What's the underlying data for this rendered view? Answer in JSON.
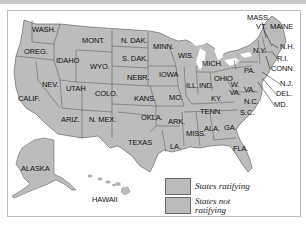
{
  "map": {
    "title": "",
    "state_fill": "#bcbcbc",
    "border_color": "#555555",
    "water_color": "#ffffff",
    "states": [
      {
        "abbr": "WASH.",
        "x": 32,
        "y": 29
      },
      {
        "abbr": "OREG.",
        "x": 24,
        "y": 51
      },
      {
        "abbr": "CALIF.",
        "x": 18,
        "y": 97
      },
      {
        "abbr": "IDAHO",
        "x": 56,
        "y": 59
      },
      {
        "abbr": "NEV.",
        "x": 42,
        "y": 83
      },
      {
        "abbr": "MONT.",
        "x": 82,
        "y": 39
      },
      {
        "abbr": "WYO.",
        "x": 90,
        "y": 65
      },
      {
        "abbr": "UTAH",
        "x": 66,
        "y": 87
      },
      {
        "abbr": "COLO.",
        "x": 95,
        "y": 92
      },
      {
        "abbr": "ARIZ.",
        "x": 61,
        "y": 118
      },
      {
        "abbr": "N. MEX.",
        "x": 89,
        "y": 118
      },
      {
        "abbr": "N. DAK.",
        "x": 121,
        "y": 39
      },
      {
        "abbr": "S. DAK.",
        "x": 122,
        "y": 57
      },
      {
        "abbr": "NEBR.",
        "x": 127,
        "y": 76
      },
      {
        "abbr": "KANS.",
        "x": 134,
        "y": 97
      },
      {
        "abbr": "OKLA.",
        "x": 141,
        "y": 116
      },
      {
        "abbr": "TEXAS",
        "x": 128,
        "y": 141
      },
      {
        "abbr": "MINN.",
        "x": 153,
        "y": 45
      },
      {
        "abbr": "IOWA",
        "x": 159,
        "y": 73
      },
      {
        "abbr": "MO.",
        "x": 169,
        "y": 96
      },
      {
        "abbr": "ARK.",
        "x": 168,
        "y": 120
      },
      {
        "abbr": "LA.",
        "x": 170,
        "y": 145
      },
      {
        "abbr": "WIS.",
        "x": 178,
        "y": 54
      },
      {
        "abbr": "ILL.",
        "x": 186,
        "y": 84
      },
      {
        "abbr": "MICH.",
        "x": 202,
        "y": 62
      },
      {
        "abbr": "IND.",
        "x": 199,
        "y": 84
      },
      {
        "abbr": "OHIO",
        "x": 214,
        "y": 77
      },
      {
        "abbr": "KY.",
        "x": 211,
        "y": 97
      },
      {
        "abbr": "TENN.",
        "x": 200,
        "y": 110
      },
      {
        "abbr": "MISS.",
        "x": 186,
        "y": 132
      },
      {
        "abbr": "ALA.",
        "x": 204,
        "y": 127
      },
      {
        "abbr": "GA.",
        "x": 224,
        "y": 126
      },
      {
        "abbr": "FLA.",
        "x": 233,
        "y": 147
      },
      {
        "abbr": "S.C.",
        "x": 240,
        "y": 111
      },
      {
        "abbr": "N.C.",
        "x": 244,
        "y": 100
      },
      {
        "abbr": "VA.",
        "x": 244,
        "y": 88
      },
      {
        "abbr": "W. VA.",
        "x": 231,
        "y": 83
      },
      {
        "abbr": "PA.",
        "x": 244,
        "y": 69
      },
      {
        "abbr": "N.Y.",
        "x": 253,
        "y": 49
      },
      {
        "abbr": "VT.",
        "x": 256,
        "y": 25
      },
      {
        "abbr": "MASS.",
        "x": 247,
        "y": 16
      },
      {
        "abbr": "MAINE",
        "x": 270,
        "y": 25
      },
      {
        "abbr": "N.H.",
        "x": 280,
        "y": 45
      },
      {
        "abbr": "R.I.",
        "x": 277,
        "y": 57
      },
      {
        "abbr": "CONN.",
        "x": 271,
        "y": 67
      },
      {
        "abbr": "N.J.",
        "x": 280,
        "y": 82
      },
      {
        "abbr": "DEL.",
        "x": 276,
        "y": 92
      },
      {
        "abbr": "MD.",
        "x": 274,
        "y": 103
      },
      {
        "abbr": "ALASKA",
        "x": 21,
        "y": 167
      },
      {
        "abbr": "HAWAII",
        "x": 92,
        "y": 198
      }
    ]
  },
  "legend": {
    "items": [
      {
        "label": "States ratifying",
        "color": "#bcbcbc"
      },
      {
        "label": "States not ratifying",
        "label_line1": "States not",
        "label_line2": "ratifying",
        "color": "#bcbcbc"
      }
    ]
  }
}
